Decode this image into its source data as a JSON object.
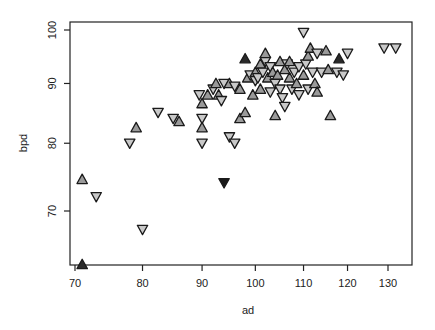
{
  "chart_data": {
    "type": "scatter",
    "title": "",
    "xlabel": "ad",
    "ylabel": "bpd",
    "xscale": "log",
    "yscale": "log",
    "xlim": [
      69.5,
      135
    ],
    "ylim": [
      62,
      101
    ],
    "xticks": [
      70,
      80,
      90,
      100,
      110,
      120,
      130
    ],
    "yticks": [
      70,
      80,
      90,
      100
    ],
    "grid": false,
    "legend": null,
    "marker_styles": {
      "up": {
        "shape": "triangle-up",
        "fill": "#9a9a9a"
      },
      "down": {
        "shape": "triangle-down",
        "fill": "#c9c9c9"
      },
      "up_dark": {
        "shape": "triangle-up",
        "fill": "#2a2a2a"
      },
      "down_dark": {
        "shape": "triangle-down",
        "fill": "#1a1a1a"
      }
    },
    "points": [
      {
        "x": 71,
        "y": 74.5,
        "m": "up"
      },
      {
        "x": 71,
        "y": 63,
        "m": "up_dark"
      },
      {
        "x": 73,
        "y": 72,
        "m": "down"
      },
      {
        "x": 80,
        "y": 67.5,
        "m": "down"
      },
      {
        "x": 78,
        "y": 80,
        "m": "down"
      },
      {
        "x": 79,
        "y": 82.5,
        "m": "up"
      },
      {
        "x": 82.5,
        "y": 85,
        "m": "down"
      },
      {
        "x": 85,
        "y": 84,
        "m": "down"
      },
      {
        "x": 86,
        "y": 83.5,
        "m": "up"
      },
      {
        "x": 89.5,
        "y": 88,
        "m": "down"
      },
      {
        "x": 90,
        "y": 84,
        "m": "down"
      },
      {
        "x": 90,
        "y": 82.5,
        "m": "up"
      },
      {
        "x": 90,
        "y": 80,
        "m": "down"
      },
      {
        "x": 90,
        "y": 86.5,
        "m": "up"
      },
      {
        "x": 91,
        "y": 88,
        "m": "up"
      },
      {
        "x": 92,
        "y": 89,
        "m": "down"
      },
      {
        "x": 92.5,
        "y": 90,
        "m": "up"
      },
      {
        "x": 93,
        "y": 88,
        "m": "up"
      },
      {
        "x": 93.5,
        "y": 87,
        "m": "down"
      },
      {
        "x": 94,
        "y": 90,
        "m": "down"
      },
      {
        "x": 95,
        "y": 90,
        "m": "up"
      },
      {
        "x": 94,
        "y": 74,
        "m": "down_dark"
      },
      {
        "x": 95,
        "y": 81,
        "m": "down"
      },
      {
        "x": 96,
        "y": 80,
        "m": "down"
      },
      {
        "x": 96,
        "y": 89.5,
        "m": "down"
      },
      {
        "x": 97,
        "y": 89,
        "m": "up"
      },
      {
        "x": 97,
        "y": 84,
        "m": "up"
      },
      {
        "x": 98,
        "y": 85,
        "m": "up"
      },
      {
        "x": 98,
        "y": 94.5,
        "m": "up_dark"
      },
      {
        "x": 98.5,
        "y": 91,
        "m": "up"
      },
      {
        "x": 99,
        "y": 91.5,
        "m": "down"
      },
      {
        "x": 99.5,
        "y": 88,
        "m": "up"
      },
      {
        "x": 100,
        "y": 90.5,
        "m": "down"
      },
      {
        "x": 100,
        "y": 92,
        "m": "up"
      },
      {
        "x": 100.5,
        "y": 91,
        "m": "down"
      },
      {
        "x": 101,
        "y": 93.5,
        "m": "up"
      },
      {
        "x": 101,
        "y": 89,
        "m": "up"
      },
      {
        "x": 101.5,
        "y": 92,
        "m": "down"
      },
      {
        "x": 102,
        "y": 94,
        "m": "down"
      },
      {
        "x": 102,
        "y": 95.5,
        "m": "up"
      },
      {
        "x": 102.5,
        "y": 91,
        "m": "up"
      },
      {
        "x": 103,
        "y": 93,
        "m": "down"
      },
      {
        "x": 103,
        "y": 88.5,
        "m": "down"
      },
      {
        "x": 103.5,
        "y": 92,
        "m": "up"
      },
      {
        "x": 104,
        "y": 84.5,
        "m": "up"
      },
      {
        "x": 104,
        "y": 90,
        "m": "down"
      },
      {
        "x": 104.5,
        "y": 91.5,
        "m": "up"
      },
      {
        "x": 105,
        "y": 94,
        "m": "up"
      },
      {
        "x": 105,
        "y": 89,
        "m": "down"
      },
      {
        "x": 105.5,
        "y": 87.5,
        "m": "down"
      },
      {
        "x": 106,
        "y": 92.5,
        "m": "up"
      },
      {
        "x": 106,
        "y": 86,
        "m": "down"
      },
      {
        "x": 106.5,
        "y": 93.5,
        "m": "down"
      },
      {
        "x": 107,
        "y": 91,
        "m": "up"
      },
      {
        "x": 107,
        "y": 94,
        "m": "up"
      },
      {
        "x": 107.5,
        "y": 89,
        "m": "down"
      },
      {
        "x": 108,
        "y": 92,
        "m": "down"
      },
      {
        "x": 108.5,
        "y": 90,
        "m": "up"
      },
      {
        "x": 109,
        "y": 93,
        "m": "down"
      },
      {
        "x": 109,
        "y": 88,
        "m": "down"
      },
      {
        "x": 110,
        "y": 99.5,
        "m": "down"
      },
      {
        "x": 110,
        "y": 91.5,
        "m": "up"
      },
      {
        "x": 110.5,
        "y": 93.5,
        "m": "down"
      },
      {
        "x": 111,
        "y": 95,
        "m": "up"
      },
      {
        "x": 111,
        "y": 89,
        "m": "down"
      },
      {
        "x": 111.5,
        "y": 96.5,
        "m": "up"
      },
      {
        "x": 112,
        "y": 92,
        "m": "down"
      },
      {
        "x": 112.5,
        "y": 90,
        "m": "up"
      },
      {
        "x": 113,
        "y": 88.5,
        "m": "up"
      },
      {
        "x": 113,
        "y": 95.5,
        "m": "down"
      },
      {
        "x": 114,
        "y": 92,
        "m": "down"
      },
      {
        "x": 115,
        "y": 96,
        "m": "up"
      },
      {
        "x": 115.5,
        "y": 92.5,
        "m": "up"
      },
      {
        "x": 116,
        "y": 84.5,
        "m": "up"
      },
      {
        "x": 117.5,
        "y": 92,
        "m": "down"
      },
      {
        "x": 118,
        "y": 94.5,
        "m": "up_dark"
      },
      {
        "x": 119,
        "y": 91.5,
        "m": "down"
      },
      {
        "x": 120,
        "y": 95.5,
        "m": "down"
      },
      {
        "x": 129,
        "y": 96.5,
        "m": "down"
      },
      {
        "x": 132,
        "y": 96.5,
        "m": "down"
      }
    ]
  },
  "layout": {
    "plot_left": 70,
    "plot_right": 412,
    "plot_top": 22,
    "plot_bottom": 265,
    "x_anchor": {
      "v0": 70,
      "p0": 75,
      "v1": 130,
      "p1": 388
    },
    "y_anchor": {
      "v0": 70,
      "p0": 211,
      "v1": 100,
      "p1": 30
    }
  }
}
